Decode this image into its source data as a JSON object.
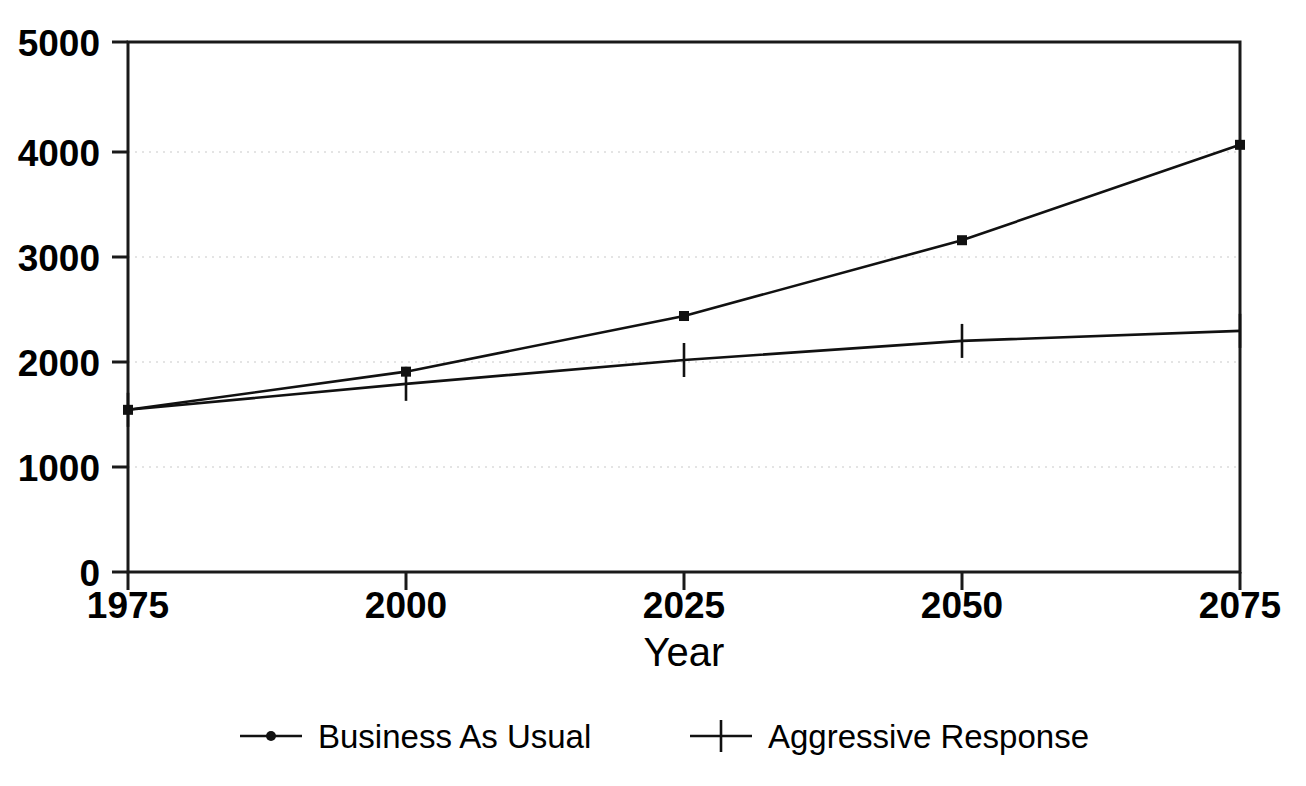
{
  "chart_data": {
    "type": "line",
    "title": "",
    "subtitle": "",
    "xlabel": "Year",
    "ylabel": "",
    "x": [
      1975,
      2000,
      2025,
      2050,
      2075
    ],
    "xticklabels": [
      "1975",
      "2000",
      "2025",
      "2050",
      "2075"
    ],
    "yticklabels": [
      "0",
      "1000",
      "2000",
      "3000",
      "4000",
      "5000"
    ],
    "yticks": [
      0,
      1000,
      2000,
      3000,
      4000,
      5000
    ],
    "xlim": [
      1975,
      2075
    ],
    "ylim": [
      0,
      5000
    ],
    "grid": true,
    "grid_axis": "y",
    "legend_position": "below-center",
    "series": [
      {
        "name": "Business As Usual",
        "marker": "dot",
        "values": [
          1530,
          1890,
          2415,
          3130,
          4030
        ]
      },
      {
        "name": "Aggressive Response",
        "marker": "plus",
        "values": [
          1530,
          1775,
          2000,
          2180,
          2275
        ]
      }
    ]
  },
  "axes": {
    "x_title": "Year",
    "y_title": ""
  },
  "legend": {
    "items": [
      {
        "label": "Business As Usual",
        "marker": "dot-marker"
      },
      {
        "label": "Aggressive Response",
        "marker": "plus-marker"
      }
    ]
  },
  "colors": {
    "line": "#111111",
    "frame": "#1a1a1a",
    "grid": "#c9c9c9",
    "background": "#ffffff"
  }
}
